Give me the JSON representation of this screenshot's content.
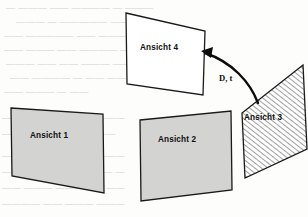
{
  "figure": {
    "canvas": {
      "width": 308,
      "height": 217,
      "background": "#fdfdfc"
    },
    "colors": {
      "fill_gray": "#d3d3d1",
      "fill_white": "#ffffff",
      "stroke": "#1a1a1a",
      "hatch": "#5a5a5a",
      "ghost_text": "#b9b6b1"
    },
    "shapes": [
      {
        "id": "ansicht-1",
        "label": "Ansicht 1",
        "style": "filled-gray",
        "points": "11,108 103,114 104,193 12,176",
        "label_x": 30,
        "label_y": 138
      },
      {
        "id": "ansicht-2",
        "label": "Ansicht 2",
        "style": "filled-gray",
        "points": "140,120 231,111 232,190 141,201",
        "label_x": 158,
        "label_y": 142
      },
      {
        "id": "ansicht-3",
        "label": "Ansicht 3",
        "style": "hatched",
        "points": "303,65 307,149 245,178 242,113",
        "label_x": 244,
        "label_y": 120
      },
      {
        "id": "ansicht-4",
        "label": "Ansicht 4",
        "style": "outline-white",
        "points": "126,13 205,31 203,95 127,84",
        "label_x": 140,
        "label_y": 50
      }
    ],
    "arrow": {
      "id": "transformation-arrow",
      "label": "D, t",
      "label_x": 219,
      "label_y": 81,
      "path": "M 258,103 C 250,82 232,62 205,53",
      "head": "201,51 213,47 211,58"
    },
    "background_text": {
      "note": "faint bleed-through scan text",
      "lines": [
        {
          "x": 6,
          "y": 10,
          "text": "— ——— —— ———— — ———"
        },
        {
          "x": 16,
          "y": 24,
          "text": "——— — ————— ———"
        },
        {
          "x": 4,
          "y": 38,
          "text": "—— ————— —— ————"
        },
        {
          "x": 4,
          "y": 52,
          "text": "—— ——— —— ———— ——"
        },
        {
          "x": 6,
          "y": 66,
          "text": "——— —— —— ——— ———"
        },
        {
          "x": 10,
          "y": 80,
          "text": "—— ———— — —— —— —"
        },
        {
          "x": 4,
          "y": 94,
          "text": "—— ——— — ——"
        },
        {
          "x": 2,
          "y": 120,
          "text": "——— ———— —— ———"
        },
        {
          "x": 2,
          "y": 136,
          "text": "—— ——— ———— ——"
        },
        {
          "x": 2,
          "y": 158,
          "text": "—— ————— —— ———"
        },
        {
          "x": 2,
          "y": 174,
          "text": "———— ———— ——— —"
        },
        {
          "x": 2,
          "y": 190,
          "text": "—— ——— ————— ——"
        },
        {
          "x": 2,
          "y": 206,
          "text": "———— —— ——— ———"
        }
      ]
    }
  }
}
